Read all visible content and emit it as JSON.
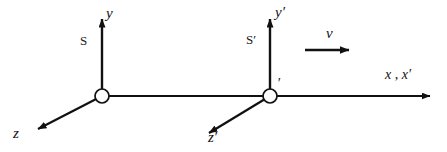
{
  "figure": {
    "background_color": "#ffffff",
    "stroke_color": "#111111",
    "width": 447,
    "height": 152
  },
  "frames": {
    "rest": {
      "name": "S",
      "origin_label": "",
      "axes": {
        "vertical": "y",
        "horizontal": "x",
        "depth": "z"
      }
    },
    "moving": {
      "name": "S′",
      "origin_label": "′",
      "axes": {
        "vertical": "y′",
        "horizontal": "x′",
        "depth": "z′"
      }
    }
  },
  "labels": {
    "y": "y",
    "y_prime": "y′",
    "x_shared": "x , x′",
    "z": "z",
    "z_prime": "z′",
    "velocity": "v",
    "frame_S": "S",
    "frame_S_prime": "S′",
    "origin_prime": "′"
  },
  "geometry": {
    "origin_S": {
      "x": 102,
      "y": 96
    },
    "origin_S_prime": {
      "x": 270,
      "y": 96
    },
    "origin_radius": 7,
    "y_axis_tip": {
      "x": 102,
      "y": 11
    },
    "y_prime_axis_tip": {
      "x": 270,
      "y": 11
    },
    "x_axis_tip": {
      "x": 438,
      "y": 96
    },
    "z_axis_tip": {
      "x": 31,
      "y": 134
    },
    "z_prime_axis_tip": {
      "x": 202,
      "y": 138
    },
    "velocity_arrow": {
      "x1": 305,
      "y1": 50,
      "x2": 357,
      "y2": 50
    }
  }
}
